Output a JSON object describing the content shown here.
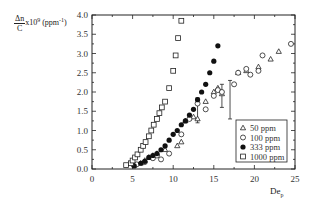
{
  "chart_data": {
    "type": "scatter",
    "title": "",
    "xlabel": "De_p",
    "ylabel": "Δn/C x10^9 (ppm^-1)",
    "xlim": [
      0,
      25
    ],
    "ylim": [
      0,
      4.0
    ],
    "xticks": [
      "0",
      "5",
      "10",
      "15",
      "20",
      "25"
    ],
    "yticks": [
      "0.0",
      "0.5",
      "1.0",
      "1.5",
      "2.0",
      "2.5",
      "3.0",
      "3.5",
      "4.0"
    ],
    "grid": false,
    "legend_position": "lower right",
    "series": [
      {
        "name": "50 ppm",
        "marker": "triangle-open",
        "x": [
          5.2,
          6.0,
          6.5,
          7.0,
          7.5,
          8.0,
          9.0,
          10.5,
          11.0,
          11.5,
          12.5,
          13.0,
          14.0,
          15.0,
          15.5,
          16.0,
          18.0,
          19.0,
          20.5,
          22.0,
          23.0
        ],
        "y": [
          0.1,
          0.15,
          0.22,
          0.3,
          0.35,
          0.4,
          0.5,
          0.6,
          0.7,
          1.25,
          1.35,
          1.3,
          1.75,
          2.0,
          2.1,
          1.95,
          2.5,
          2.55,
          2.65,
          2.85,
          3.05
        ]
      },
      {
        "name": "100 ppm",
        "marker": "circle-open",
        "x": [
          5.5,
          6.5,
          7.5,
          8.0,
          8.5,
          9.5,
          11.0,
          12.0,
          13.0,
          14.0,
          15.0,
          15.5,
          16.0,
          17.5,
          18.0,
          19.0,
          19.5,
          20.5,
          21.0,
          24.5
        ],
        "y": [
          0.12,
          0.18,
          0.28,
          0.35,
          0.25,
          0.4,
          0.9,
          1.3,
          1.7,
          1.55,
          1.9,
          2.05,
          2.0,
          2.2,
          2.5,
          2.6,
          2.45,
          2.55,
          2.95,
          3.25
        ]
      },
      {
        "name": "333 ppm",
        "marker": "circle-filled",
        "x": [
          5.2,
          6.0,
          6.5,
          7.0,
          7.5,
          8.0,
          8.5,
          9.0,
          9.5,
          10.0,
          10.5,
          11.0,
          11.5,
          12.0,
          12.5,
          13.0,
          13.5,
          14.0,
          14.5,
          15.0,
          15.5
        ],
        "y": [
          0.08,
          0.15,
          0.2,
          0.3,
          0.35,
          0.4,
          0.5,
          0.6,
          0.75,
          0.9,
          1.0,
          1.15,
          1.25,
          1.4,
          1.55,
          1.8,
          2.0,
          2.2,
          2.5,
          2.8,
          3.2
        ]
      },
      {
        "name": "1000 ppm",
        "marker": "square-open",
        "x": [
          4.2,
          4.8,
          5.0,
          5.3,
          5.6,
          6.0,
          6.3,
          6.6,
          7.0,
          7.3,
          7.6,
          8.0,
          8.3,
          8.6,
          9.0,
          9.5,
          10.0,
          10.3,
          10.6,
          11.0
        ],
        "y": [
          0.1,
          0.15,
          0.22,
          0.3,
          0.38,
          0.5,
          0.6,
          0.7,
          0.85,
          1.0,
          1.15,
          1.3,
          1.45,
          1.6,
          1.75,
          2.1,
          2.55,
          2.95,
          3.4,
          3.85
        ]
      }
    ],
    "annotations": [
      "error bars near De_p≈14–17, y≈1.5–2.2"
    ]
  },
  "axis": {
    "ylabel_num": "Δn",
    "ylabel_den": "C",
    "ylabel_rest": "x10",
    "ylabel_exp": "9",
    "ylabel_unit": " (ppm",
    "ylabel_unit_exp": "-1",
    "ylabel_close": ")",
    "xlabel_main": "De",
    "xlabel_sub": "p"
  },
  "legend": [
    "50 ppm",
    "100 ppm",
    "333 ppm",
    "1000 ppm"
  ]
}
